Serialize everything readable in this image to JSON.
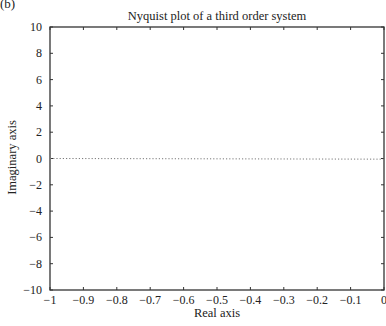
{
  "panel_label": "(b)",
  "chart_data": {
    "type": "line",
    "title": "Nyquist plot of a third order system",
    "xlabel": "Real axis",
    "ylabel": "Imaginary axis",
    "xlim": [
      -1,
      0
    ],
    "ylim": [
      -10,
      10
    ],
    "xticks": [
      -1,
      -0.9,
      -0.8,
      -0.7,
      -0.6,
      -0.5,
      -0.4,
      -0.3,
      -0.2,
      -0.1,
      0
    ],
    "xtick_labels": [
      "−1",
      "−0.9",
      "−0.8",
      "−0.7",
      "−0.6",
      "−0.5",
      "−0.4",
      "−0.3",
      "−0.2",
      "−0.1",
      "0"
    ],
    "yticks": [
      -10,
      -8,
      -6,
      -4,
      -2,
      0,
      2,
      4,
      6,
      8,
      10
    ],
    "ytick_labels": [
      "−10",
      "−8",
      "−6",
      "−4",
      "−2",
      "0",
      "2",
      "4",
      "6",
      "8",
      "10"
    ],
    "grid": false,
    "series": [
      {
        "name": "zero-line",
        "style": "dotted",
        "x": [
          -1,
          0
        ],
        "y": [
          0,
          -0.05
        ]
      }
    ]
  }
}
